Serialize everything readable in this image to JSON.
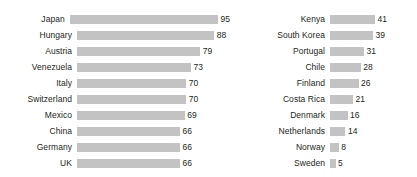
{
  "chart_data": [
    {
      "type": "bar",
      "orientation": "horizontal",
      "title": "",
      "xlabel": "",
      "ylabel": "",
      "grid": false,
      "legend": "none",
      "panel": "left",
      "xlim": [
        0,
        95
      ],
      "px_per_unit": 1.56,
      "categories": [
        "Japan",
        "Hungary",
        "Austria",
        "Venezuela",
        "Italy",
        "Switzerland",
        "Mexico",
        "China",
        "Germany",
        "UK"
      ],
      "values": [
        95,
        88,
        79,
        73,
        70,
        70,
        69,
        66,
        66,
        66
      ],
      "value_labels": [
        "95",
        "88",
        "79",
        "73",
        "70",
        "70",
        "69",
        "66",
        "66",
        "66"
      ]
    },
    {
      "type": "bar",
      "orientation": "horizontal",
      "title": "",
      "xlabel": "",
      "ylabel": "",
      "grid": false,
      "legend": "none",
      "panel": "right",
      "xlim": [
        0,
        41
      ],
      "px_per_unit": 1.1,
      "categories": [
        "Kenya",
        "South Korea",
        "Portugal",
        "Chile",
        "Finland",
        "Costa Rica",
        "Denmark",
        "Netherlands",
        "Norway",
        "Sweden"
      ],
      "values": [
        41,
        39,
        31,
        28,
        26,
        21,
        16,
        14,
        8,
        5
      ],
      "value_labels": [
        "41",
        "39",
        "31",
        "28",
        "26",
        "21",
        "16",
        "14",
        "8",
        "5"
      ]
    }
  ],
  "style": {
    "bar_color": "#c3c3c3",
    "text_color": "#231f20",
    "background": "#ffffff"
  }
}
